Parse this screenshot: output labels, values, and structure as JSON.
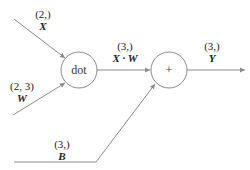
{
  "diagram": {
    "type": "computational-graph",
    "nodes": [
      {
        "id": "dot",
        "label": "dot",
        "cx": 79,
        "cy": 70,
        "r": 18
      },
      {
        "id": "add",
        "label": "+",
        "cx": 169,
        "cy": 70,
        "r": 18
      }
    ],
    "inputs": {
      "x": {
        "shape": "(2,)",
        "name": "X"
      },
      "w": {
        "shape": "(2, 3)",
        "name": "W"
      },
      "b": {
        "shape": "(3,)",
        "name": "B"
      }
    },
    "intermediate": {
      "xw": {
        "shape": "(3,)",
        "name": "X · W"
      }
    },
    "output": {
      "y": {
        "shape": "(3,)",
        "name": "Y"
      }
    },
    "edges": [
      {
        "from": "X",
        "to": "dot"
      },
      {
        "from": "W",
        "to": "dot"
      },
      {
        "from": "dot",
        "to": "add",
        "label": "X · W"
      },
      {
        "from": "B",
        "to": "add"
      },
      {
        "from": "add",
        "to": "Y"
      }
    ]
  }
}
